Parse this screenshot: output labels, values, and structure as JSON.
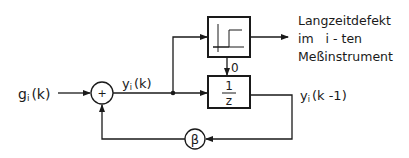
{
  "diagram": {
    "type": "block-diagram",
    "input_label": "gᵢ(k)",
    "input_label_main": "g",
    "input_label_sub": "i",
    "input_label_arg": "(k)",
    "sum_symbol": "+",
    "sum_output_label_main": "y",
    "sum_output_label_sub": "i",
    "sum_output_label_arg": "(k)",
    "threshold_block": {
      "name": "step-threshold",
      "icon": "step-function-icon"
    },
    "threshold_to_delay_label": "0",
    "delay_block": {
      "numerator": "1",
      "denominator": "z"
    },
    "delay_output_label_main": "y",
    "delay_output_label_sub": "i",
    "delay_output_label_arg": "(k -1)",
    "feedback_gain": "β",
    "output_description": [
      "Langzeitdefekt",
      "im   i - ten",
      "Meßinstrument"
    ]
  }
}
